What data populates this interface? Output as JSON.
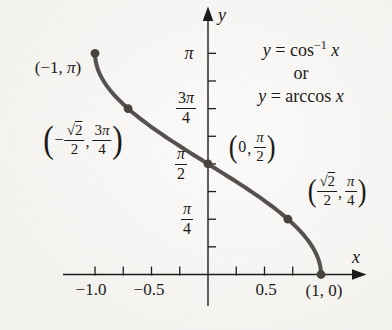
{
  "figure": {
    "axes": {
      "x_label": "x",
      "y_label": "y",
      "x_tick_labels": {
        "neg1": "−1.0",
        "neg05": "−0.5",
        "pos05": "0.5"
      },
      "y_tick_labels": {
        "pi": "π",
        "three_pi_4": {
          "num_coeff": "3",
          "num_var": "π",
          "den": "4"
        },
        "pi_2": {
          "num_var": "π",
          "den": "2"
        },
        "pi_4": {
          "num_var": "π",
          "den": "4"
        }
      }
    },
    "equation": {
      "line1": {
        "lhs": "y",
        "rel": "=",
        "fn": "cos",
        "sup": "−1",
        "arg": "x"
      },
      "line2": "or",
      "line3": {
        "lhs": "y",
        "rel": "=",
        "fn": "arccos",
        "arg": "x"
      }
    },
    "point_labels": {
      "neg1_pi": {
        "open": "(−1, ",
        "pi": "π",
        "close": ")"
      },
      "one_zero": "(1, 0)",
      "neg_sqrt2_2_3pi_4": {
        "open": "(",
        "minus": "−",
        "sqrt": "√",
        "radicand": "2",
        "den": "2",
        "comma": ",",
        "num2_coeff": "3",
        "num2_var": "π",
        "den2": "4",
        "close": ")"
      },
      "zero_pi_2": {
        "open": "(",
        "x": "0",
        "comma": ",",
        "num_var": "π",
        "den": "2",
        "close": ")"
      },
      "sqrt2_2_pi_4": {
        "open": "(",
        "sqrt": "√",
        "radicand": "2",
        "den": "2",
        "comma": ",",
        "num2_var": "π",
        "den2": "4",
        "close": ")"
      }
    }
  },
  "chart_data": {
    "type": "line",
    "function": "arccos",
    "x_range": [
      -1,
      1
    ],
    "y_range_radians": [
      0,
      3.14159
    ],
    "xlabel": "x",
    "ylabel": "y",
    "grid": false,
    "key_points": [
      {
        "x": -1,
        "y": 3.14159,
        "label": "(−1, π)"
      },
      {
        "x": -0.70711,
        "y": 2.35619,
        "label": "(−√2/2, 3π/4)"
      },
      {
        "x": 0,
        "y": 1.5708,
        "label": "(0, π/2)"
      },
      {
        "x": 0.70711,
        "y": 0.7854,
        "label": "(√2/2, π/4)"
      },
      {
        "x": 1,
        "y": 0,
        "label": "(1, 0)"
      }
    ],
    "x_ticks": [
      -1,
      -0.75,
      -0.5,
      -0.25,
      0.25,
      0.5,
      0.75
    ],
    "y_ticks_radians": [
      0.3927,
      0.7854,
      1.1781,
      1.5708,
      1.9635,
      2.3562,
      2.7489,
      3.14159
    ],
    "colors": {
      "curve": "#54514e",
      "point": "#47443f",
      "axis": "#1d1c1a",
      "text": "#1b1a18",
      "background": "#f2f1ee"
    }
  }
}
